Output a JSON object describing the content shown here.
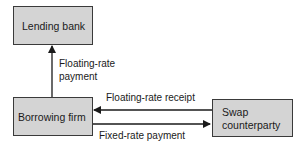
{
  "nodes": {
    "lending_bank": "Lending bank",
    "borrowing_firm": "Borrowing firm",
    "swap_line1": "Swap",
    "swap_line2": "counterparty"
  },
  "edges": {
    "floating_payment_line1": "Floating-rate",
    "floating_payment_line2": "payment",
    "floating_receipt": "Floating-rate receipt",
    "fixed_payment": "Fixed-rate payment"
  },
  "colors": {
    "box_fill": "#d4d4d4",
    "border": "#3a3a3a"
  }
}
